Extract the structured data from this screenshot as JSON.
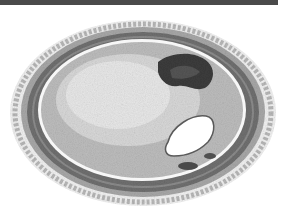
{
  "image": {
    "description": "Grayscale histology illustration of an artery cross-section showing thickened intimal plaque, a dark pigmented deposit and a small eccentric white lumen",
    "colors": {
      "background": "#ffffff",
      "topbar": "#4a4a4a",
      "adventitia": "#9a9a9a",
      "media": "#6e6e6e",
      "intima": "#d4d4d4",
      "plaque_core": "#e6e6e6",
      "deposit": "#3a3a3a",
      "lumen": "#ffffff"
    }
  }
}
